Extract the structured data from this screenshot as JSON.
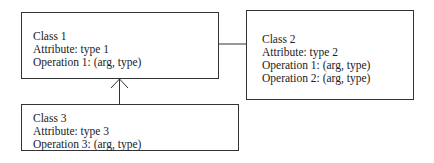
{
  "diagram": {
    "type": "uml-class-diagram",
    "classes": [
      {
        "id": "class1",
        "name": "Class 1",
        "attribute": "Attribute: type 1",
        "operations": [
          "Operation 1: (arg, type)"
        ]
      },
      {
        "id": "class2",
        "name": "Class 2",
        "attribute": "Attribute: type 2",
        "operations": [
          "Operation 1: (arg, type)",
          "Operation 2: (arg, type)"
        ]
      },
      {
        "id": "class3",
        "name": "Class 3",
        "attribute": "Attribute: type 3",
        "operations": [
          "Operation 3: (arg, type)"
        ]
      }
    ],
    "relationships": [
      {
        "from": "Class 1",
        "to": "Class 2",
        "kind": "association"
      },
      {
        "from": "Class 3",
        "to": "Class 1",
        "kind": "directed-association-open-arrow"
      }
    ],
    "colors": {
      "line": "#333333",
      "text": "#222222",
      "background": "#ffffff"
    }
  }
}
